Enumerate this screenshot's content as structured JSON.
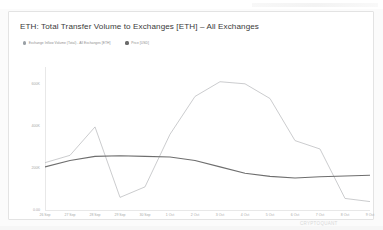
{
  "card": {
    "title": "ETH: Total Transfer Volume to Exchanges [ETH] – All Exchanges"
  },
  "legend": {
    "items": [
      {
        "label": "Exchange Inflow Volume (Total) - All Exchanges [ETH]",
        "color": "#9aa0a6",
        "icon": "legend-dot-icon"
      },
      {
        "label": "Price [USD]",
        "color": "#6b6b6b",
        "icon": "legend-dot-icon"
      }
    ]
  },
  "footer": {
    "watermark": "CRYPTOQUANT"
  },
  "chart_data": {
    "type": "line",
    "title": "ETH: Total Transfer Volume to Exchanges [ETH] – All Exchanges",
    "xlabel": "",
    "ylabel": "",
    "grid": false,
    "legend_position": "top-left",
    "categories": [
      "26 Sep",
      "27 Sep",
      "28 Sep",
      "29 Sep",
      "30 Sep",
      "1 Oct",
      "2 Oct",
      "3 Oct",
      "4 Oct",
      "5 Oct",
      "6 Oct",
      "7 Oct",
      "8 Oct",
      "9 Oct"
    ],
    "yticks": [
      "600K",
      "400K",
      "200K",
      "0.00"
    ],
    "ylim": [
      0,
      680000
    ],
    "ytick_values": [
      600000,
      400000,
      200000,
      0
    ],
    "series": [
      {
        "name": "Exchange Inflow Volume (Total) - All Exchanges [ETH]",
        "color": "#b9bbbd",
        "axis": "left",
        "values": [
          225000,
          260000,
          395000,
          60000,
          110000,
          360000,
          540000,
          610000,
          600000,
          530000,
          330000,
          290000,
          55000,
          40000
        ]
      },
      {
        "name": "Price [USD]",
        "color": "#6e6e6e",
        "axis": "right",
        "values": [
          205000,
          235000,
          255000,
          258000,
          255000,
          252000,
          235000,
          205000,
          175000,
          160000,
          152000,
          158000,
          162000,
          165000
        ]
      }
    ],
    "series_extra": [
      {
        "name": "Exchange Inflow Volume (Total) - All Exchanges [ETH] tail",
        "color": "#b9bbbd",
        "values_tail": [
          600000,
          450000,
          55000,
          45000,
          505000,
          455000
        ]
      }
    ]
  }
}
